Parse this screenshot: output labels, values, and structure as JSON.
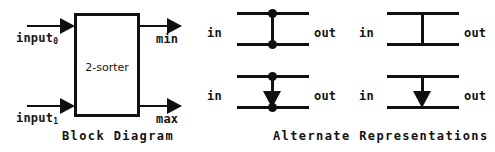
{
  "figure": {
    "background_color": "#ffffff",
    "ink_color": "#101010"
  },
  "block_diagram": {
    "caption": "Block Diagram",
    "box_label": "2-sorter",
    "inputs": [
      {
        "label": "input",
        "subscript": "0"
      },
      {
        "label": "input",
        "subscript": "1"
      }
    ],
    "outputs": [
      {
        "label": "min"
      },
      {
        "label": "max"
      }
    ]
  },
  "alternate_representations": {
    "caption": "Alternate Representations",
    "variants": [
      {
        "id": "dots-plain-line",
        "in_label": "in",
        "out_label": "out",
        "connector": "vertical-line",
        "top_dot": true,
        "bottom_dot": true,
        "arrow": false
      },
      {
        "id": "plain-line",
        "in_label": "in",
        "out_label": "out",
        "connector": "vertical-line",
        "top_dot": false,
        "bottom_dot": false,
        "arrow": false
      },
      {
        "id": "dots-arrow",
        "in_label": "in",
        "out_label": "out",
        "connector": "vertical-arrow",
        "top_dot": true,
        "bottom_dot": true,
        "arrow": true
      },
      {
        "id": "plain-arrow",
        "in_label": "in",
        "out_label": "out",
        "connector": "vertical-arrow",
        "top_dot": false,
        "bottom_dot": false,
        "arrow": true
      }
    ]
  }
}
